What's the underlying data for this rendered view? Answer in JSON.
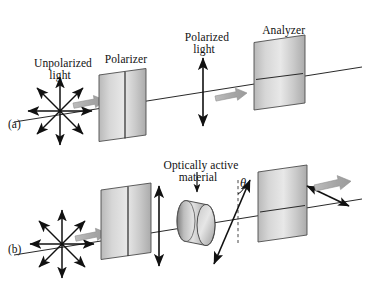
{
  "figure": {
    "background_color": "#ffffff",
    "ink_color": "#111111",
    "plate_fill_light": "#e4e4e4",
    "plate_fill_dark": "#9a9a9a",
    "plate_edge_color": "#4a4a4a",
    "block_arrow_color": "#a8a8a8",
    "block_arrow_edge": "#8a8a8a",
    "cylinder_fill_light": "#d8d8d8",
    "cylinder_fill_dark": "#8e8e8e"
  },
  "labels": {
    "unpolarized_light": "Unpolarized\nlight",
    "polarizer": "Polarizer",
    "polarized_light": "Polarized\nlight",
    "analyzer": "Analyzer",
    "optically_active_material": "Optically active\nmaterial",
    "theta": "θ",
    "panel_a": "(a)",
    "panel_b": "(b)"
  },
  "panels": [
    {
      "id": "a",
      "tag": "(a)",
      "elements": [
        {
          "name": "unpolarized-starburst",
          "kind": "starburst",
          "rays": 8,
          "double_headed": true
        },
        {
          "name": "polarizer-plate",
          "kind": "plate",
          "axis": "vertical"
        },
        {
          "name": "polarized-light-arrow",
          "kind": "double-arrow",
          "orientation": "vertical"
        },
        {
          "name": "analyzer-plate",
          "kind": "plate",
          "axis": "horizontal"
        },
        {
          "name": "beam-axis-line",
          "kind": "line"
        },
        {
          "name": "propagation-block-arrow-1",
          "kind": "block-arrow"
        },
        {
          "name": "propagation-block-arrow-2",
          "kind": "block-arrow"
        }
      ]
    },
    {
      "id": "b",
      "tag": "(b)",
      "elements": [
        {
          "name": "unpolarized-starburst",
          "kind": "starburst",
          "rays": 8,
          "double_headed": true
        },
        {
          "name": "polarizer-plate",
          "kind": "plate",
          "axis": "vertical"
        },
        {
          "name": "polarized-light-arrow",
          "kind": "double-arrow",
          "orientation": "vertical"
        },
        {
          "name": "optically-active-cylinder",
          "kind": "cylinder"
        },
        {
          "name": "rotated-polarization-arrow",
          "kind": "double-arrow",
          "orientation": "tilted",
          "tilt_degrees": 22
        },
        {
          "name": "theta-angle-arc",
          "kind": "arc"
        },
        {
          "name": "vertical-reference-dashed-line",
          "kind": "dashed-line"
        },
        {
          "name": "analyzer-plate",
          "kind": "plate",
          "axis": "horizontal"
        },
        {
          "name": "output-polarization-arrow",
          "kind": "double-arrow",
          "orientation": "tilted"
        },
        {
          "name": "beam-axis-line",
          "kind": "line"
        },
        {
          "name": "propagation-block-arrow-1",
          "kind": "block-arrow"
        },
        {
          "name": "propagation-block-arrow-2",
          "kind": "block-arrow"
        }
      ]
    }
  ]
}
